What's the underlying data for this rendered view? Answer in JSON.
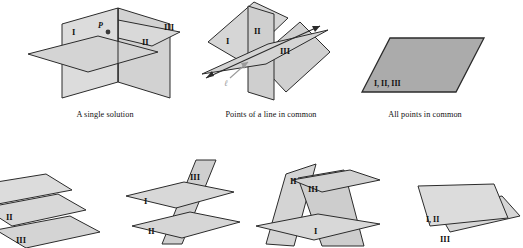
{
  "figure": {
    "colors": {
      "plane_light": "#d9d9d9",
      "plane_mid": "#c9c9c9",
      "plane_dark": "#ababab",
      "stroke": "#2b2b2b",
      "label_gray": "#9b9b9b",
      "background": "#ffffff"
    }
  },
  "panels": [
    {
      "id": "single-solution",
      "caption": "A single solution",
      "labels": [
        "I",
        "II",
        "III"
      ],
      "point_label": "P"
    },
    {
      "id": "line-in-common",
      "caption": "Points of a line in common",
      "labels": [
        "I",
        "II",
        "III"
      ],
      "line_label": "ℓ"
    },
    {
      "id": "all-points-in-common",
      "caption": "All points in common",
      "labels": [
        "I, II, III"
      ]
    },
    {
      "id": "three-parallel-planes",
      "caption": "",
      "labels": [
        "I",
        "II",
        "III"
      ]
    },
    {
      "id": "two-parallel-cut-by-third",
      "caption": "",
      "labels": [
        "I",
        "II",
        "III"
      ]
    },
    {
      "id": "prism-no-common-point",
      "caption": "",
      "labels": [
        "I",
        "II",
        "III"
      ]
    },
    {
      "id": "coincident-and-parallel",
      "caption": "",
      "labels": [
        "I, II",
        "III"
      ]
    }
  ]
}
